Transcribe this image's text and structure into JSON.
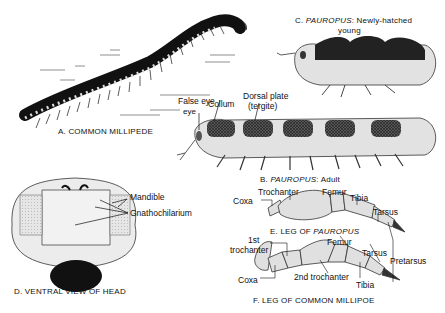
{
  "figure": {
    "panels": [
      {
        "id": "A",
        "caption": "A. COMMON MILLIPEDE"
      },
      {
        "id": "B",
        "caption_prefix": "B. ",
        "caption_genus": "PAUROPUS",
        "caption_suffix": ": Adult",
        "labels": [
          "False eye",
          "Collum",
          "Dorsal plate",
          "(tergite)"
        ]
      },
      {
        "id": "C",
        "caption_prefix": "C. ",
        "caption_genus": "PAUROPUS",
        "caption_suffix": ": Newly-hatched",
        "caption_line2": "young"
      },
      {
        "id": "D",
        "caption": "D. VENTRAL VIEW OF HEAD",
        "labels": [
          "Mandible",
          "Gnathochilarium"
        ]
      },
      {
        "id": "E",
        "caption_prefix": "E. LEG OF ",
        "caption_genus": "PAUROPUS",
        "labels": [
          "Coxa",
          "Trochanter",
          "Femur",
          "Tibia",
          "Tarsus"
        ]
      },
      {
        "id": "F",
        "caption": "F. LEG OF COMMON MILLIPOE",
        "labels": [
          "1st",
          "trochanter",
          "Coxa",
          "Femur",
          "Tarsus",
          "Pretarsus",
          "2nd trochanter",
          "Tibia"
        ]
      }
    ]
  }
}
